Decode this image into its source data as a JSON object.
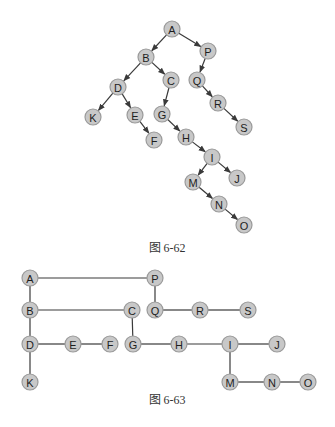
{
  "figure_62": {
    "caption": "图 6-62",
    "caption_pos": [
      167,
      252
    ],
    "nodes": [
      {
        "id": "A",
        "x": 172,
        "y": 29
      },
      {
        "id": "B",
        "x": 146,
        "y": 57
      },
      {
        "id": "P",
        "x": 208,
        "y": 51
      },
      {
        "id": "D",
        "x": 118,
        "y": 87
      },
      {
        "id": "C",
        "x": 171,
        "y": 80
      },
      {
        "id": "Q",
        "x": 197,
        "y": 80
      },
      {
        "id": "K",
        "x": 93,
        "y": 117
      },
      {
        "id": "E",
        "x": 135,
        "y": 115
      },
      {
        "id": "G",
        "x": 162,
        "y": 114
      },
      {
        "id": "R",
        "x": 218,
        "y": 103
      },
      {
        "id": "S",
        "x": 244,
        "y": 127
      },
      {
        "id": "F",
        "x": 154,
        "y": 140
      },
      {
        "id": "H",
        "x": 186,
        "y": 137
      },
      {
        "id": "I",
        "x": 212,
        "y": 157
      },
      {
        "id": "J",
        "x": 237,
        "y": 178
      },
      {
        "id": "M",
        "x": 193,
        "y": 182
      },
      {
        "id": "N",
        "x": 219,
        "y": 204
      },
      {
        "id": "O",
        "x": 244,
        "y": 225
      }
    ],
    "edges": [
      [
        "A",
        "B"
      ],
      [
        "A",
        "P"
      ],
      [
        "B",
        "D"
      ],
      [
        "B",
        "C"
      ],
      [
        "P",
        "Q"
      ],
      [
        "D",
        "K"
      ],
      [
        "D",
        "E"
      ],
      [
        "C",
        "G"
      ],
      [
        "Q",
        "R"
      ],
      [
        "R",
        "S"
      ],
      [
        "E",
        "F"
      ],
      [
        "G",
        "H"
      ],
      [
        "H",
        "I"
      ],
      [
        "I",
        "M"
      ],
      [
        "I",
        "J"
      ],
      [
        "M",
        "N"
      ],
      [
        "N",
        "O"
      ]
    ]
  },
  "figure_63": {
    "caption": "图 6-63",
    "caption_pos": [
      167,
      404
    ],
    "nodes": [
      {
        "id": "A",
        "x": 30,
        "y": 278
      },
      {
        "id": "P",
        "x": 155,
        "y": 278
      },
      {
        "id": "B",
        "x": 30,
        "y": 310
      },
      {
        "id": "C",
        "x": 132,
        "y": 310
      },
      {
        "id": "Q",
        "x": 155,
        "y": 310
      },
      {
        "id": "R",
        "x": 200,
        "y": 310
      },
      {
        "id": "S",
        "x": 248,
        "y": 310
      },
      {
        "id": "D",
        "x": 30,
        "y": 344
      },
      {
        "id": "E",
        "x": 73,
        "y": 344
      },
      {
        "id": "F",
        "x": 110,
        "y": 344
      },
      {
        "id": "G",
        "x": 133,
        "y": 344
      },
      {
        "id": "H",
        "x": 179,
        "y": 344
      },
      {
        "id": "I",
        "x": 230,
        "y": 344
      },
      {
        "id": "J",
        "x": 277,
        "y": 344
      },
      {
        "id": "K",
        "x": 30,
        "y": 382
      },
      {
        "id": "M",
        "x": 230,
        "y": 382
      },
      {
        "id": "N",
        "x": 272,
        "y": 382
      },
      {
        "id": "O",
        "x": 308,
        "y": 382
      }
    ],
    "edges": [
      [
        "A",
        "P"
      ],
      [
        "A",
        "B"
      ],
      [
        "P",
        "Q"
      ],
      [
        "B",
        "C"
      ],
      [
        "B",
        "D"
      ],
      [
        "Q",
        "R"
      ],
      [
        "R",
        "S"
      ],
      [
        "C",
        "G"
      ],
      [
        "D",
        "E"
      ],
      [
        "E",
        "F"
      ],
      [
        "D",
        "K"
      ],
      [
        "G",
        "H"
      ],
      [
        "H",
        "I"
      ],
      [
        "I",
        "J"
      ],
      [
        "I",
        "M"
      ],
      [
        "M",
        "N"
      ],
      [
        "N",
        "O"
      ]
    ]
  },
  "style": {
    "node_fill": "#c8c8c8",
    "node_stroke": "#9a9a9a",
    "edge_color": "#3a3a3a",
    "node_radius": 8
  }
}
